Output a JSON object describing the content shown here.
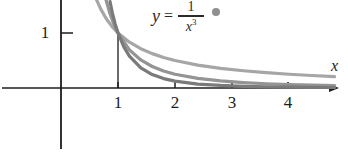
{
  "figure": {
    "background_color": "#ffffff",
    "axis_color": "#1c1c1c"
  },
  "equation": {
    "lhs": "y",
    "equals": "=",
    "numerator": "1",
    "denominator_base": "x",
    "denominator_exponent": "3",
    "marker_color": "#8f8f8f"
  },
  "axes": {
    "x_label": "x",
    "x_ticks": [
      "1",
      "2",
      "3",
      "4"
    ],
    "y_ticks": [
      "1"
    ]
  },
  "chart_data": {
    "type": "line",
    "title": "",
    "xlabel": "x",
    "ylabel": "",
    "xlim": [
      -1.05,
      4.8
    ],
    "ylim": [
      -1.1,
      1.6
    ],
    "grid": false,
    "legend_position": "none",
    "annotations": [
      {
        "text": "y = 1/x^3",
        "x": 1.85,
        "y": 1.55,
        "marker": "filled-circle",
        "marker_color": "#8f8f8f"
      }
    ],
    "x_tick_values": [
      1,
      2,
      3,
      4
    ],
    "y_tick_values": [
      1
    ],
    "series": [
      {
        "name": "y = 1/x",
        "color": "#a6a6a6",
        "formula": "1/x",
        "x": [
          0.62,
          0.7,
          0.8,
          0.9,
          1.0,
          1.2,
          1.4,
          1.6,
          1.8,
          2.0,
          2.4,
          2.8,
          3.2,
          3.6,
          4.0,
          4.4,
          4.8
        ],
        "y": [
          1.613,
          1.429,
          1.25,
          1.111,
          1.0,
          0.833,
          0.714,
          0.625,
          0.556,
          0.5,
          0.417,
          0.357,
          0.313,
          0.278,
          0.25,
          0.227,
          0.208
        ]
      },
      {
        "name": "y = 1/x^2",
        "color": "#949494",
        "formula": "1/x^2",
        "x": [
          0.79,
          0.85,
          0.9,
          0.95,
          1.0,
          1.2,
          1.4,
          1.6,
          1.8,
          2.0,
          2.4,
          2.8,
          3.2,
          3.6,
          4.0,
          4.4,
          4.8
        ],
        "y": [
          1.602,
          1.384,
          1.235,
          1.108,
          1.0,
          0.694,
          0.51,
          0.391,
          0.309,
          0.25,
          0.174,
          0.128,
          0.098,
          0.077,
          0.063,
          0.052,
          0.043
        ]
      },
      {
        "name": "y = 1/x^3",
        "color": "#7a7a7a",
        "formula": "1/x^3",
        "x": [
          0.86,
          0.9,
          0.95,
          1.0,
          1.1,
          1.2,
          1.4,
          1.6,
          1.8,
          2.0,
          2.4,
          2.8,
          3.2,
          3.6,
          4.0,
          4.4,
          4.8
        ],
        "y": [
          1.572,
          1.372,
          1.166,
          1.0,
          0.751,
          0.579,
          0.364,
          0.244,
          0.171,
          0.125,
          0.072,
          0.046,
          0.031,
          0.021,
          0.016,
          0.012,
          0.009
        ]
      }
    ]
  }
}
